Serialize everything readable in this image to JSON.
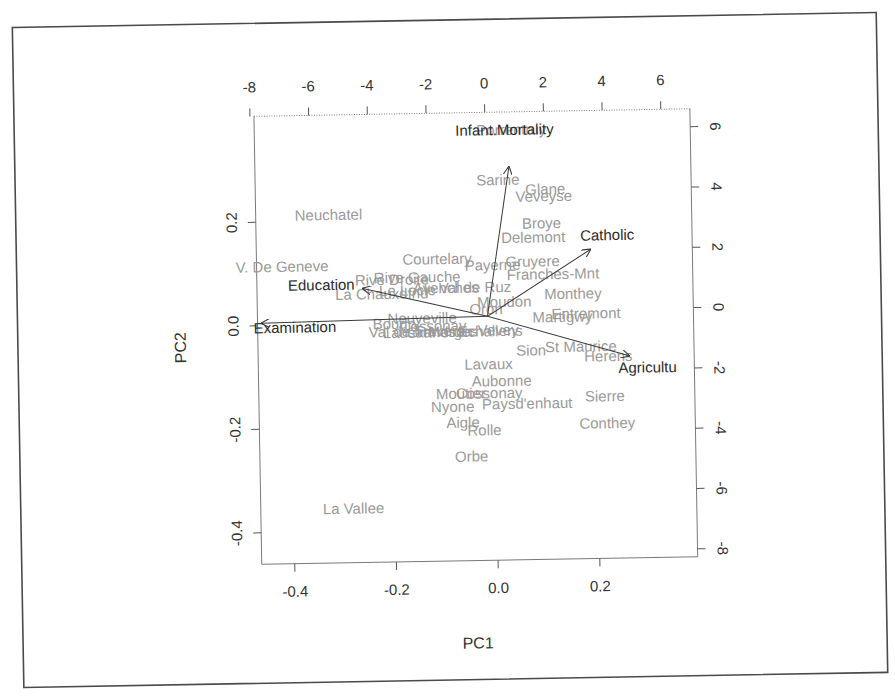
{
  "chart_data": {
    "type": "scatter",
    "subtype": "biplot",
    "title": "",
    "xlabel": "PC1",
    "ylabel": "PC2",
    "xlim": [
      -0.46,
      0.37
    ],
    "ylim": [
      -0.46,
      0.39
    ],
    "bottom_ticks": [
      "-0.4",
      "-0.2",
      "0.0",
      "0.2"
    ],
    "left_ticks": [
      "0.2",
      "0.0",
      "-0.2",
      "-0.4"
    ],
    "top_ticks": [
      "-8",
      "-6",
      "-4",
      "-2",
      "0",
      "2",
      "4",
      "6"
    ],
    "right_ticks": [
      "6",
      "4",
      "2",
      "0",
      "-2",
      "-4",
      "-6",
      "-8"
    ],
    "observations": [
      {
        "name": "Porrentruy",
        "x": 0.02,
        "y": 0.365
      },
      {
        "name": "Sarine",
        "x": 0.03,
        "y": 0.265
      },
      {
        "name": "Glane",
        "x": 0.115,
        "y": 0.25
      },
      {
        "name": "Veveyse",
        "x": 0.12,
        "y": 0.235
      },
      {
        "name": "Neuchatel",
        "x": -0.34,
        "y": 0.205
      },
      {
        "name": "Broye",
        "x": 0.105,
        "y": 0.185
      },
      {
        "name": "Delemont",
        "x": 0.1,
        "y": 0.158
      },
      {
        "name": "Courtelary",
        "x": -0.1,
        "y": 0.113
      },
      {
        "name": "Paysd.enhaut.top",
        "x": 0.02,
        "y": 0.107
      },
      {
        "name": "Gruyere",
        "x": 0.08,
        "y": 0.107
      },
      {
        "name": "V. De Geneve",
        "x": -0.44,
        "y": 0.106
      },
      {
        "name": "Franches-Mnt",
        "x": 0.1,
        "y": 0.085
      },
      {
        "name": "Rive Droite",
        "x": -0.2,
        "y": 0.08
      },
      {
        "name": "Rive Gauche",
        "x": -0.14,
        "y": 0.08
      },
      {
        "name": "La Chauxdfnd",
        "x": -0.2,
        "y": 0.055
      },
      {
        "name": "Le Locle",
        "x": -0.1,
        "y": 0.057
      },
      {
        "name": "Val de Ruz",
        "x": -0.06,
        "y": 0.057
      },
      {
        "name": "Avenches",
        "x": -0.04,
        "y": 0.056
      },
      {
        "name": "Payerne",
        "x": 0.0,
        "y": 0.055
      },
      {
        "name": "Monthey",
        "x": 0.145,
        "y": 0.047
      },
      {
        "name": "Moudon",
        "x": 0.04,
        "y": 0.035
      },
      {
        "name": "Oron",
        "x": 0.02,
        "y": 0.02
      },
      {
        "name": "Glane.mid",
        "x": 0.03,
        "y": 0.025
      },
      {
        "name": "Entremont",
        "x": 0.17,
        "y": 0.0
      },
      {
        "name": "Martigwy",
        "x": 0.14,
        "y": -0.005
      },
      {
        "name": "Neuveville",
        "x": -0.07,
        "y": -0.005
      },
      {
        "name": "Boudry",
        "x": -0.14,
        "y": -0.01
      },
      {
        "name": "Cossonay",
        "x": -0.07,
        "y": -0.015
      },
      {
        "name": "Val de Travers",
        "x": -0.17,
        "y": -0.025
      },
      {
        "name": "Lausanne",
        "x": -0.12,
        "y": -0.028
      },
      {
        "name": "Grandson",
        "x": -0.1,
        "y": -0.028
      },
      {
        "name": "Echallens",
        "x": 0.0,
        "y": -0.03
      },
      {
        "name": "Morges",
        "x": -0.06,
        "y": -0.03
      },
      {
        "name": "Yverdon",
        "x": -0.03,
        "y": -0.03
      },
      {
        "name": "Rolle.mid",
        "x": -0.02,
        "y": -0.03
      },
      {
        "name": "Vevey",
        "x": 0.02,
        "y": -0.03
      },
      {
        "name": "St Maurice",
        "x": 0.15,
        "y": -0.055
      },
      {
        "name": "Sion",
        "x": 0.09,
        "y": -0.06
      },
      {
        "name": "Herens",
        "x": 0.23,
        "y": -0.07
      },
      {
        "name": "Lavaux",
        "x": -0.03,
        "y": -0.08
      },
      {
        "name": "Aubonne",
        "x": 0.0,
        "y": -0.115
      },
      {
        "name": "Moutier",
        "x": -0.07,
        "y": -0.135
      },
      {
        "name": "Oron.low",
        "x": -0.04,
        "y": -0.135
      },
      {
        "name": "Sierre",
        "x": 0.22,
        "y": -0.155
      },
      {
        "name": "Nyone",
        "x": -0.09,
        "y": -0.16
      },
      {
        "name": "Paysd'enhaut",
        "x": 0.01,
        "y": -0.16
      },
      {
        "name": "Aigle",
        "x": -0.06,
        "y": -0.195
      },
      {
        "name": "Rolle",
        "x": -0.04,
        "y": -0.205
      },
      {
        "name": "Conthey",
        "x": 0.21,
        "y": -0.2
      },
      {
        "name": "Orbe",
        "x": -0.04,
        "y": -0.25
      },
      {
        "name": "La Vallee",
        "x": -0.32,
        "y": -0.36
      }
    ],
    "variables": [
      {
        "name": "Infant.Mortality",
        "x": 0.035,
        "y": 0.295
      },
      {
        "name": "Catholic",
        "x": 0.2,
        "y": 0.135
      },
      {
        "name": "Education",
        "x": -0.24,
        "y": 0.07
      },
      {
        "name": "Examination",
        "x": -0.44,
        "y": 0.003
      },
      {
        "name": "Agriculture",
        "x": 0.26,
        "y": -0.07
      }
    ]
  },
  "labels": {
    "pc1": "PC1",
    "pc2": "PC2"
  },
  "display": {
    "observations_visible": [
      {
        "text": "Porrentruy",
        "x": 480,
        "y": 136
      },
      {
        "text": "Sarine",
        "x": 479,
        "y": 186
      },
      {
        "text": "Glane",
        "x": 528,
        "y": 196
      },
      {
        "text": "Veveyse",
        "x": 518,
        "y": 203
      },
      {
        "text": "Neuchatel",
        "x": 297,
        "y": 218
      },
      {
        "text": "Broye",
        "x": 524,
        "y": 230
      },
      {
        "text": "Delemont",
        "x": 503,
        "y": 244
      },
      {
        "text": "Courtelary",
        "x": 404,
        "y": 264
      },
      {
        "text": "Payerne",
        "x": 466,
        "y": 271
      },
      {
        "text": "Gruyere",
        "x": 507,
        "y": 268
      },
      {
        "text": "V. De Geneve",
        "x": 237,
        "y": 269
      },
      {
        "text": "Franches-Mnt",
        "x": 508,
        "y": 281
      },
      {
        "text": "Rive Droite",
        "x": 356,
        "y": 284
      },
      {
        "text": "Rive Gauche",
        "x": 375,
        "y": 282
      },
      {
        "text": "La Chauxdfnd",
        "x": 336,
        "y": 298
      },
      {
        "text": "Le Locle",
        "x": 380,
        "y": 295
      },
      {
        "text": "Avenches",
        "x": 414,
        "y": 293
      },
      {
        "text": "Val de Ruz",
        "x": 440,
        "y": 293
      },
      {
        "text": "Monthey",
        "x": 545,
        "y": 301
      },
      {
        "text": "Moudon",
        "x": 478,
        "y": 308
      },
      {
        "text": "Oron",
        "x": 470,
        "y": 315
      },
      {
        "text": "Entremont",
        "x": 552,
        "y": 321
      },
      {
        "text": "Martigwy",
        "x": 533,
        "y": 324
      },
      {
        "text": "Neuveville",
        "x": 388,
        "y": 323
      },
      {
        "text": "Boudry",
        "x": 373,
        "y": 328
      },
      {
        "text": "Cossonay",
        "x": 400,
        "y": 331
      },
      {
        "text": "Val de Travers",
        "x": 369,
        "y": 336
      },
      {
        "text": "Lausanne",
        "x": 383,
        "y": 337
      },
      {
        "text": "Grandson",
        "x": 407,
        "y": 337
      },
      {
        "text": "Echallens",
        "x": 458,
        "y": 337
      },
      {
        "text": "Morges",
        "x": 428,
        "y": 337
      },
      {
        "text": "Vevey",
        "x": 478,
        "y": 336
      },
      {
        "text": "St Maurice",
        "x": 545,
        "y": 354
      },
      {
        "text": "Sion",
        "x": 516,
        "y": 357
      },
      {
        "text": "Herens",
        "x": 584,
        "y": 364
      },
      {
        "text": "Lavaux",
        "x": 464,
        "y": 370
      },
      {
        "text": "Aubonne",
        "x": 471,
        "y": 387
      },
      {
        "text": "Moutier",
        "x": 435,
        "y": 399
      },
      {
        "text": "Cossonay",
        "x": 455,
        "y": 399
      },
      {
        "text": "Sierre",
        "x": 584,
        "y": 404
      },
      {
        "text": "Nyone",
        "x": 430,
        "y": 412
      },
      {
        "text": "Paysd'enhaut",
        "x": 481,
        "y": 410
      },
      {
        "text": "Aigle",
        "x": 445,
        "y": 428
      },
      {
        "text": "Rolle",
        "x": 466,
        "y": 436
      },
      {
        "text": "Conthey",
        "x": 578,
        "y": 431
      },
      {
        "text": "Orbe",
        "x": 453,
        "y": 462
      },
      {
        "text": "La Vallee",
        "x": 320,
        "y": 512
      }
    ],
    "variables_visible": [
      {
        "text": "Infant.Mortality",
        "x": 459,
        "y": 136
      },
      {
        "text": "Catholic",
        "x": 582,
        "y": 243
      },
      {
        "text": "Education",
        "x": 289,
        "y": 288
      },
      {
        "text": "Examination",
        "x": 254,
        "y": 330
      },
      {
        "text": "Agricultu",
        "x": 618,
        "y": 376
      }
    ],
    "arrow_origin": {
      "x": 488,
      "y": 317
    },
    "arrows": [
      {
        "name": "Infant.Mortality",
        "x2": 512,
        "y2": 168
      },
      {
        "name": "Catholic",
        "x2": 592,
        "y2": 252
      },
      {
        "name": "Education",
        "x2": 364,
        "y2": 287
      },
      {
        "name": "Examination",
        "x2": 262,
        "y2": 320
      },
      {
        "name": "Agriculture",
        "x2": 629,
        "y2": 359
      }
    ]
  }
}
